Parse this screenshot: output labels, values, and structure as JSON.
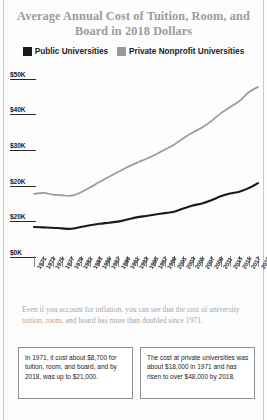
{
  "chart_data": {
    "type": "line",
    "title": "Average Annual Cost of Tuition, Room, and Board in 2018 Dollars",
    "xlabel": "",
    "ylabel": "",
    "grid": false,
    "legend_position": "top-center",
    "ylim": [
      0,
      55000
    ],
    "ytick_labels": [
      "$50K",
      "$40K",
      "$30K",
      "$20K",
      "$20K",
      "$0K"
    ],
    "ytick_values": [
      50000,
      40000,
      30000,
      20000,
      10000,
      0
    ],
    "x": [
      1971,
      1973,
      1975,
      1977,
      1979,
      1981,
      1983,
      1985,
      1987,
      1989,
      1991,
      1993,
      1995,
      1997,
      1999,
      2001,
      2003,
      2005,
      2007,
      2009,
      2011,
      2013,
      2015,
      2017,
      2018
    ],
    "xtick_labels": [
      "1971",
      "1973",
      "1975",
      "1977",
      "1979",
      "1981",
      "1983",
      "1985",
      "1987",
      "1989",
      "1991",
      "1993",
      "1995",
      "1997",
      "1999",
      "2001",
      "2003",
      "2005",
      "2007",
      "2009",
      "2011",
      "2013",
      "2015",
      "2017",
      "2018"
    ],
    "series": [
      {
        "name": "Public Universities",
        "color": "#1a1a1a",
        "values": [
          8700,
          8600,
          8500,
          8300,
          8200,
          8700,
          9200,
          9600,
          9900,
          10200,
          10800,
          11400,
          11800,
          12200,
          12600,
          13000,
          13900,
          14700,
          15300,
          16200,
          17300,
          18100,
          18600,
          19600,
          21000
        ]
      },
      {
        "name": "Private Nonprofit Universities",
        "color": "#9a9a9a",
        "values": [
          18000,
          18300,
          17800,
          17600,
          17500,
          18400,
          19800,
          21300,
          22700,
          24100,
          25500,
          26700,
          27800,
          29000,
          30400,
          31800,
          33600,
          35200,
          36600,
          38400,
          40600,
          42300,
          44000,
          46500,
          48000
        ]
      }
    ]
  },
  "legend": [
    {
      "label": "Public Universities",
      "color": "#1a1a1a",
      "swatch_name": "legend-swatch-public"
    },
    {
      "label": "Private Nonprofit Universities",
      "color": "#9a9a9a",
      "swatch_name": "legend-swatch-private"
    }
  ],
  "caption": "Even if you account for inflation, you can see that the cost of university tuition, room, and board has more than doubled since 1971.",
  "callouts": [
    {
      "text": "In 1971, it cost about $8,700 for tuition, room, and board, and by 2018, was up to $21,000."
    },
    {
      "text": "The cost at private universities was about $18,000 in 1971 and has risen to over $48,000 by 2018."
    }
  ]
}
